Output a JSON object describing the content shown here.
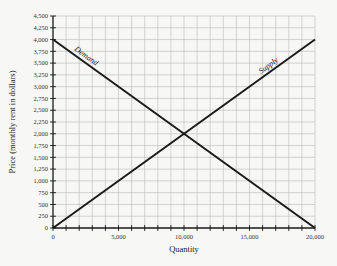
{
  "chart_data": {
    "type": "line",
    "title": "",
    "xlabel": "Quantity",
    "ylabel": "Price (monthly rent in dollars)",
    "xlim": [
      0,
      20000
    ],
    "ylim": [
      0,
      4500
    ],
    "x_ticks": [
      0,
      5000,
      10000,
      15000,
      20000
    ],
    "x_tick_labels": [
      "0",
      "5,000",
      "10,000",
      "15,000",
      "20,000"
    ],
    "y_ticks": [
      0,
      250,
      500,
      750,
      1000,
      1250,
      1500,
      1750,
      2000,
      2250,
      2500,
      2750,
      3000,
      3250,
      3500,
      3750,
      4000,
      4250,
      4500
    ],
    "y_tick_labels": [
      "0",
      "250",
      "500",
      "750",
      "1,000",
      "1,250",
      "1,500",
      "1,750",
      "2,000",
      "2,250",
      "2,500",
      "2,750",
      "3,000",
      "3,250",
      "3,500",
      "3,750",
      "4,000",
      "4,250",
      "4,500"
    ],
    "grid": true,
    "x_grid_step": 1000,
    "y_grid_step": 250,
    "series": [
      {
        "name": "Demand",
        "x": [
          0,
          20000
        ],
        "y": [
          4000,
          0
        ]
      },
      {
        "name": "Supply",
        "x": [
          0,
          20000
        ],
        "y": [
          0,
          4000
        ]
      }
    ],
    "annotations": [
      {
        "text": "Demand",
        "near": [
          3000,
          3500
        ]
      },
      {
        "text": "Supply",
        "near": [
          16500,
          3400
        ]
      }
    ],
    "equilibrium": {
      "quantity": 10000,
      "price": 2000
    }
  },
  "colors": {
    "background": "#f7f7f5",
    "grid": "#b8b8b8",
    "line": "#1a1a1a",
    "axis": "#1a1a1a"
  }
}
